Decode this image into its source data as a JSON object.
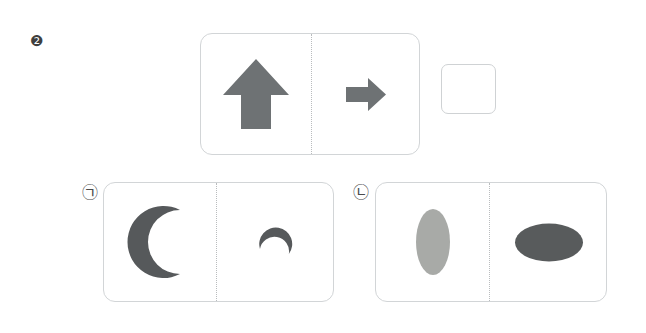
{
  "page": {
    "background_color": "#ffffff",
    "width": 646,
    "height": 333
  },
  "question": {
    "number_label": "❷",
    "prompt_card": {
      "left_shape": {
        "name": "up-arrow",
        "glyph": "⬆",
        "color": "#6e7274",
        "orientation_degrees": 0,
        "size": "large"
      },
      "right_shape": {
        "name": "right-arrow",
        "glyph": "➡",
        "color": "#6e7274",
        "orientation_degrees": 90,
        "size": "small"
      },
      "divider": "dotted"
    },
    "answer_slot": {
      "name": "empty-answer-box",
      "value": "",
      "border_color": "#cfd2d4"
    }
  },
  "options": [
    {
      "label": "㉠",
      "label_name": "option-label-giyeok",
      "left_shape": {
        "name": "crescent-moon",
        "color": "#56595b",
        "orientation_degrees": 0,
        "size": "large",
        "opening": "right"
      },
      "right_shape": {
        "name": "crescent-moon",
        "color": "#56595b",
        "orientation_degrees": 100,
        "size": "small",
        "opening": "down"
      },
      "divider": "dotted"
    },
    {
      "label": "㉡",
      "label_name": "option-label-nieun",
      "left_shape": {
        "name": "vertical-ellipse",
        "color": "#a8aaa7",
        "orientation_degrees": 0,
        "size": "large"
      },
      "right_shape": {
        "name": "horizontal-ellipse",
        "color": "#585b5c",
        "orientation_degrees": 90,
        "size": "large"
      },
      "divider": "dotted"
    }
  ],
  "colors": {
    "arrow_gray": "#6e7274",
    "moon_gray": "#56595b",
    "light_ellipse_gray": "#a8aaa7",
    "dark_ellipse_gray": "#585b5c",
    "card_border": "#d2d5d7",
    "divider": "#b9bcbe"
  }
}
